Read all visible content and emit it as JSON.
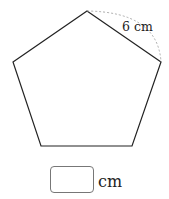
{
  "diagram": {
    "shape": "regular pentagon",
    "side_label": "6 cm",
    "stroke_color": "#222222",
    "arc_color": "#999999"
  },
  "answer": {
    "value": "",
    "unit": "cm"
  }
}
